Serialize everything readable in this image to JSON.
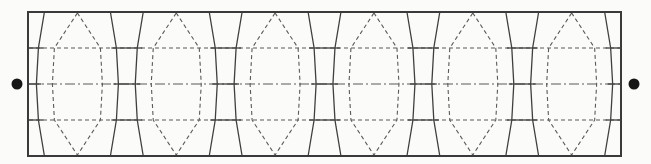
{
  "diagram": {
    "canvas": {
      "width": 651,
      "height": 164,
      "background": "#fbfbf9"
    },
    "frame": {
      "x1": 28,
      "y1": 12,
      "x2": 621,
      "y2": 156,
      "stroke": "#3a3a3a",
      "stroke_width": 2
    },
    "end_dots": {
      "color": "#161616",
      "radius": 5.5,
      "left": {
        "cx": 17,
        "cy": 84
      },
      "right": {
        "cx": 634,
        "cy": 84
      }
    },
    "cells": {
      "count": 6,
      "first_center_x": 77.4,
      "period": 98.85,
      "node_ys": [
        12,
        48,
        84,
        120,
        156
      ],
      "solid_offsets": [
        33,
        39,
        41,
        39,
        33
      ],
      "hexagon_offsets": [
        0,
        23,
        25,
        23,
        0
      ],
      "hexagon_apex_inset": 1,
      "solid_stroke": "#3f3f3f",
      "solid_width": 1.3,
      "dash_stroke": "#5a5a5a",
      "dash_width": 1.1,
      "hexagon_dash_array": "4 3"
    },
    "horizontals": {
      "lines": [
        {
          "y": 48,
          "kind": "quarter-line",
          "dash_array": "4 3"
        },
        {
          "y": 84,
          "kind": "center-line",
          "dash_array": "10 3 2 3"
        },
        {
          "y": 120,
          "kind": "quarter-line",
          "dash_array": "4 3"
        }
      ],
      "dash_stroke": "#5a5a5a",
      "dash_width": 1.1,
      "solid_stroke": "#3f3f3f",
      "solid_width": 1.3,
      "solid_overhang": 5
    }
  }
}
